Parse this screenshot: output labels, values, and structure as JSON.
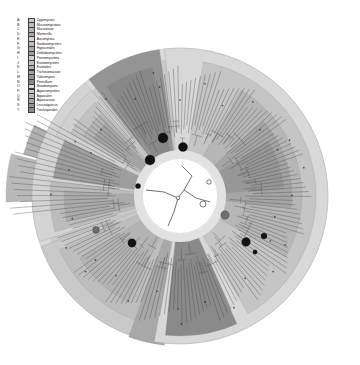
{
  "figure": {
    "type": "circular-phylogenetic-tree",
    "palette": {
      "background": "#ffffff",
      "outer_ring": "#d9d9d9",
      "disc_light": "#c9c9c9",
      "disc_mid": "#b0b0b0",
      "sector_dark": "#8c8c8c",
      "sector_darker": "#7a7a7a",
      "sector_light": "#dcdcdc",
      "inner_circle": "#ffffff",
      "inner_ring": "#e2e2e2",
      "branch": "#4a4a4a",
      "node_filled": "#111111",
      "node_mid": "#6f6f6f",
      "node_open": "#ffffff"
    },
    "geometry": {
      "center_x": 196,
      "center_y": 196,
      "outer_radius": 148,
      "ring_inner_radius": 136,
      "inner_circle_radius": 38,
      "tip_radius": 120
    }
  },
  "legend": {
    "rows": [
      {
        "abbr": "A:",
        "name": "Zygomycota",
        "color": "#c9c9c9"
      },
      {
        "abbr": "B:",
        "name": "Mucoromycotina",
        "color": "#bdbdbd"
      },
      {
        "abbr": "C:",
        "name": "Mucorineae",
        "color": "#b3b3b3"
      },
      {
        "abbr": "D:",
        "name": "Mortierella",
        "color": "#a8a8a8"
      },
      {
        "abbr": "E:",
        "name": "Ascomycota",
        "color": "#d4d4d4"
      },
      {
        "abbr": "F:",
        "name": "Sordariomycetes",
        "color": "#bcbcbc"
      },
      {
        "abbr": "G:",
        "name": "Hypocreales",
        "color": "#ababab"
      },
      {
        "abbr": "H:",
        "name": "Dothideomycetes",
        "color": "#9e9e9e"
      },
      {
        "abbr": "I:",
        "name": "Pezizomycotina",
        "color": "#d0d0d0"
      },
      {
        "abbr": "J:",
        "name": "Eurotiomycetes",
        "color": "#c2c2c2"
      },
      {
        "abbr": "K:",
        "name": "Eurotiales",
        "color": "#b4b4b4"
      },
      {
        "abbr": "L:",
        "name": "Trichocomaceae",
        "color": "#a3a3a3"
      },
      {
        "abbr": "M:",
        "name": "Talaromyces",
        "color": "#949494"
      },
      {
        "abbr": "N:",
        "name": "Penicillium",
        "color": "#888888"
      },
      {
        "abbr": "O:",
        "name": "Basidiomycota",
        "color": "#d8d8d8"
      },
      {
        "abbr": "P:",
        "name": "Agaricomycetes",
        "color": "#c5c5c5"
      },
      {
        "abbr": "Q:",
        "name": "Agaricales",
        "color": "#b6b6b6"
      },
      {
        "abbr": "R:",
        "name": "Agaricaceae",
        "color": "#a5a5a5"
      },
      {
        "abbr": "S:",
        "name": "Leucoagaricus",
        "color": "#979797"
      },
      {
        "abbr": "T:",
        "name": "Trechisporales",
        "color": "#8a8a8a"
      }
    ]
  },
  "chart_data": {
    "type": "tree",
    "title": "",
    "sectors": [
      {
        "label": "A",
        "start_deg": 196,
        "end_deg": 250,
        "radius": 148,
        "color": "#c9c9c9"
      },
      {
        "label": "B",
        "start_deg": 200,
        "end_deg": 246,
        "radius": 132,
        "color": "#bdbdbd"
      },
      {
        "label": "C",
        "start_deg": 206,
        "end_deg": 238,
        "radius": 118,
        "color": "#b3b3b3"
      },
      {
        "label": "D",
        "start_deg": 186,
        "end_deg": 200,
        "radius": 150,
        "color": "#a8a8a8"
      },
      {
        "label": "E",
        "start_deg": 252,
        "end_deg": 320,
        "radius": 148,
        "color": "#d4d4d4"
      },
      {
        "label": "F",
        "start_deg": 254,
        "end_deg": 276,
        "radius": 130,
        "color": "#bcbcbc"
      },
      {
        "label": "G",
        "start_deg": 258,
        "end_deg": 272,
        "radius": 116,
        "color": "#ababab"
      },
      {
        "label": "H",
        "start_deg": 278,
        "end_deg": 296,
        "radius": 128,
        "color": "#9e9e9e"
      },
      {
        "label": "I",
        "start_deg": 296,
        "end_deg": 320,
        "radius": 138,
        "color": "#d0d0d0"
      },
      {
        "label": "J",
        "start_deg": 300,
        "end_deg": 318,
        "radius": 126,
        "color": "#c2c2c2"
      },
      {
        "label": "K",
        "start_deg": 302,
        "end_deg": 316,
        "radius": 114,
        "color": "#b4b4b4"
      },
      {
        "label": "L",
        "start_deg": 304,
        "end_deg": 314,
        "radius": 104,
        "color": "#a3a3a3"
      },
      {
        "label": "M",
        "start_deg": 322,
        "end_deg": 352,
        "radius": 148,
        "color": "#949494"
      },
      {
        "label": "N",
        "start_deg": 326,
        "end_deg": 348,
        "radius": 132,
        "color": "#888888"
      },
      {
        "label": "O",
        "start_deg": 354,
        "end_deg": 190,
        "radius": 148,
        "color": "#d8d8d8"
      },
      {
        "label": "P",
        "start_deg": 10,
        "end_deg": 150,
        "radius": 136,
        "color": "#c5c5c5"
      },
      {
        "label": "Q",
        "start_deg": 30,
        "end_deg": 120,
        "radius": 122,
        "color": "#b6b6b6"
      },
      {
        "label": "R",
        "start_deg": 48,
        "end_deg": 96,
        "radius": 112,
        "color": "#a5a5a5"
      },
      {
        "label": "S",
        "start_deg": 58,
        "end_deg": 86,
        "radius": 104,
        "color": "#979797"
      },
      {
        "label": "T",
        "start_deg": 156,
        "end_deg": 186,
        "radius": 140,
        "color": "#8a8a8a"
      }
    ],
    "tip_count": 170,
    "node_markers": [
      {
        "x": 179,
        "y": 138,
        "r": 5.0,
        "fill": "#111111"
      },
      {
        "x": 199,
        "y": 147,
        "r": 4.6,
        "fill": "#111111"
      },
      {
        "x": 166,
        "y": 160,
        "r": 5.0,
        "fill": "#111111"
      },
      {
        "x": 241,
        "y": 215,
        "r": 4.2,
        "fill": "#6f6f6f"
      },
      {
        "x": 219,
        "y": 204,
        "r": 3.0,
        "fill": "#ffffff"
      },
      {
        "x": 148,
        "y": 243,
        "r": 4.2,
        "fill": "#111111"
      },
      {
        "x": 112,
        "y": 230,
        "r": 3.4,
        "fill": "#6f6f6f"
      },
      {
        "x": 262,
        "y": 242,
        "r": 4.4,
        "fill": "#111111"
      },
      {
        "x": 280,
        "y": 236,
        "r": 3.0,
        "fill": "#111111"
      },
      {
        "x": 271,
        "y": 252,
        "r": 2.2,
        "fill": "#111111"
      },
      {
        "x": 154,
        "y": 186,
        "r": 2.6,
        "fill": "#111111"
      },
      {
        "x": 225,
        "y": 182,
        "r": 2.2,
        "fill": "#ffffff"
      }
    ]
  }
}
